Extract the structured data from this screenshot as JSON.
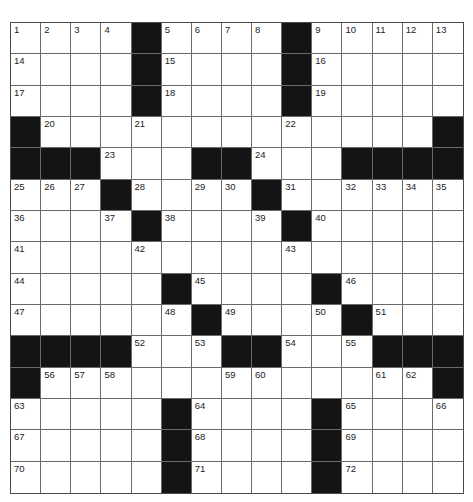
{
  "puzzle": {
    "rows": 15,
    "cols": 15,
    "colors": {
      "black_cell": "#141414",
      "white_cell": "#ffffff",
      "grid_line": "#6a6a6a",
      "number_text": "#222222"
    },
    "layout": [
      "....#....#.....",
      "....#....#.....",
      "....#....#.....",
      "#.............#",
      "###...##...####",
      "...#....#......",
      "....#....#.....",
      "...............",
      ".....#....#....",
      "......#....#...",
      "####...##...###",
      "#.............#",
      ".....#....#....",
      ".....#....#....",
      ".....#....#...."
    ],
    "numbers": [
      [
        1,
        2,
        3,
        4,
        0,
        5,
        6,
        7,
        8,
        0,
        9,
        10,
        11,
        12,
        13
      ],
      [
        14,
        0,
        0,
        0,
        0,
        15,
        0,
        0,
        0,
        0,
        16,
        0,
        0,
        0,
        0
      ],
      [
        17,
        0,
        0,
        0,
        0,
        18,
        0,
        0,
        0,
        0,
        19,
        0,
        0,
        0,
        0
      ],
      [
        0,
        20,
        0,
        0,
        21,
        0,
        0,
        0,
        0,
        22,
        0,
        0,
        0,
        0,
        0
      ],
      [
        0,
        0,
        0,
        23,
        0,
        0,
        0,
        0,
        24,
        0,
        0,
        0,
        0,
        0,
        0
      ],
      [
        25,
        26,
        27,
        0,
        28,
        0,
        29,
        30,
        0,
        31,
        0,
        32,
        33,
        34,
        35
      ],
      [
        36,
        0,
        0,
        37,
        0,
        38,
        0,
        0,
        39,
        0,
        40,
        0,
        0,
        0,
        0
      ],
      [
        41,
        0,
        0,
        0,
        42,
        0,
        0,
        0,
        0,
        43,
        0,
        0,
        0,
        0,
        0
      ],
      [
        44,
        0,
        0,
        0,
        0,
        0,
        45,
        0,
        0,
        0,
        0,
        46,
        0,
        0,
        0
      ],
      [
        47,
        0,
        0,
        0,
        0,
        48,
        0,
        49,
        0,
        0,
        50,
        0,
        51,
        0,
        0
      ],
      [
        0,
        0,
        0,
        0,
        52,
        0,
        53,
        0,
        0,
        54,
        0,
        55,
        0,
        0,
        0
      ],
      [
        0,
        56,
        57,
        58,
        0,
        0,
        0,
        59,
        60,
        0,
        0,
        0,
        61,
        62,
        0
      ],
      [
        63,
        0,
        0,
        0,
        0,
        0,
        64,
        0,
        0,
        0,
        0,
        65,
        0,
        0,
        66
      ],
      [
        67,
        0,
        0,
        0,
        0,
        0,
        68,
        0,
        0,
        0,
        0,
        69,
        0,
        0,
        0
      ],
      [
        70,
        0,
        0,
        0,
        0,
        0,
        71,
        0,
        0,
        0,
        0,
        72,
        0,
        0,
        0
      ]
    ]
  }
}
